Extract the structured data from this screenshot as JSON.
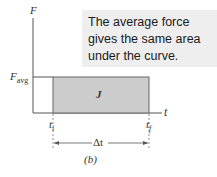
{
  "callout": {
    "text": "The average force gives the same area under the curve."
  },
  "axes": {
    "y_label": "F",
    "x_label": "t"
  },
  "labels": {
    "f_avg": "F",
    "f_avg_sub": "avg",
    "area": "J",
    "t_i": "t",
    "t_i_sub": "i",
    "t_f": "t",
    "t_f_sub": "f",
    "delta_t": "Δt",
    "caption": "(b)"
  },
  "colors": {
    "rect_fill": "#cccccc",
    "rect_stroke": "#555555",
    "axis": "#444444",
    "callout_bg": "#eeeeee"
  }
}
